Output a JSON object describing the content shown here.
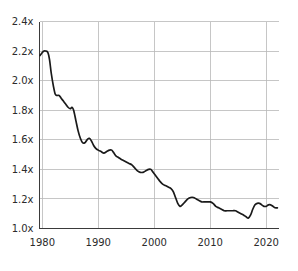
{
  "chart_data": {
    "type": "line",
    "title": "",
    "subtitle": "",
    "xlabel": "",
    "ylabel": "",
    "xlim": [
      1979.5,
      2022.2
    ],
    "ylim": [
      1.0,
      2.4
    ],
    "grid": true,
    "legend": null,
    "legend_position": "none",
    "y_ticks": [
      1.0,
      1.2,
      1.4,
      1.6,
      1.8,
      2.0,
      2.2,
      2.4
    ],
    "y_tick_labels": [
      "1.0x",
      "1.2x",
      "1.4x",
      "1.6x",
      "1.8x",
      "2.0x",
      "2.2x",
      "2.4x"
    ],
    "x_ticks": [
      1980,
      1990,
      2000,
      2010,
      2020
    ],
    "x_tick_labels": [
      "1980",
      "1990",
      "2000",
      "2010",
      "2020"
    ],
    "series": [
      {
        "name": "ratio",
        "color": "#1a1a1a",
        "x": [
          1979.6,
          1980.0,
          1980.3,
          1980.6,
          1981.0,
          1981.3,
          1981.6,
          1982.0,
          1982.3,
          1982.6,
          1983.0,
          1983.4,
          1983.8,
          1984.2,
          1984.6,
          1985.0,
          1985.3,
          1985.6,
          1986.0,
          1986.4,
          1986.8,
          1987.2,
          1987.6,
          1988.0,
          1988.4,
          1988.8,
          1989.2,
          1989.6,
          1990.0,
          1990.5,
          1991.0,
          1991.5,
          1992.0,
          1992.4,
          1992.8,
          1993.2,
          1993.6,
          1994.0,
          1994.5,
          1995.0,
          1995.5,
          1996.0,
          1996.5,
          1997.0,
          1997.5,
          1998.0,
          1998.5,
          1999.0,
          1999.4,
          1999.8,
          2000.2,
          2000.6,
          2001.0,
          2001.5,
          2002.0,
          2002.5,
          2003.0,
          2003.4,
          2003.8,
          2004.2,
          2004.6,
          2005.0,
          2005.5,
          2006.0,
          2006.5,
          2007.0,
          2007.5,
          2008.0,
          2008.5,
          2009.0,
          2009.5,
          2010.0,
          2010.5,
          2011.0,
          2011.5,
          2012.0,
          2012.5,
          2013.0,
          2013.5,
          2014.0,
          2014.5,
          2015.0,
          2015.5,
          2016.0,
          2016.4,
          2016.8,
          2017.2,
          2017.6,
          2018.0,
          2018.4,
          2018.8,
          2019.2,
          2019.6,
          2020.0,
          2020.4,
          2020.8,
          2021.2,
          2021.6,
          2022.0
        ],
        "values": [
          2.17,
          2.19,
          2.2,
          2.2,
          2.19,
          2.14,
          2.05,
          1.96,
          1.91,
          1.9,
          1.9,
          1.88,
          1.86,
          1.84,
          1.82,
          1.81,
          1.82,
          1.8,
          1.73,
          1.66,
          1.61,
          1.58,
          1.58,
          1.6,
          1.61,
          1.59,
          1.56,
          1.54,
          1.53,
          1.52,
          1.51,
          1.52,
          1.53,
          1.53,
          1.51,
          1.49,
          1.48,
          1.47,
          1.46,
          1.45,
          1.44,
          1.43,
          1.41,
          1.39,
          1.38,
          1.38,
          1.39,
          1.4,
          1.4,
          1.38,
          1.36,
          1.34,
          1.32,
          1.3,
          1.29,
          1.28,
          1.27,
          1.25,
          1.21,
          1.17,
          1.15,
          1.16,
          1.18,
          1.2,
          1.21,
          1.21,
          1.2,
          1.19,
          1.18,
          1.18,
          1.18,
          1.18,
          1.17,
          1.15,
          1.14,
          1.13,
          1.12,
          1.12,
          1.12,
          1.12,
          1.12,
          1.11,
          1.1,
          1.09,
          1.08,
          1.07,
          1.09,
          1.13,
          1.16,
          1.17,
          1.17,
          1.16,
          1.15,
          1.15,
          1.16,
          1.16,
          1.15,
          1.14,
          1.14
        ]
      }
    ]
  },
  "colors": {
    "line": "#1a1a1a",
    "grid": "#b8b8b8",
    "axis": "#3a3a3a",
    "text": "#2b2b2b",
    "background": "#ffffff"
  }
}
